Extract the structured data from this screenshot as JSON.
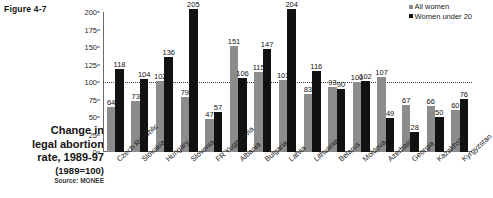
{
  "figure": {
    "label": "Figure 4-7",
    "caption_line1": "Change in",
    "caption_line2": "legal abortion",
    "caption_line3": "rate, 1989-97",
    "caption_sub": "(1989=100)",
    "caption_source": "Source: MONEE"
  },
  "legend": {
    "items": [
      {
        "label": "All women",
        "color": "#8c8c8c"
      },
      {
        "label": "Women under 20",
        "color": "#111111"
      }
    ]
  },
  "chart_data": {
    "type": "bar",
    "title": "Change in legal abortion rate, 1989-97",
    "subtitle": "(1989=100)",
    "xlabel": "",
    "ylabel": "",
    "ylim": [
      0,
      200
    ],
    "yticks": [
      0,
      25,
      50,
      75,
      100,
      125,
      150,
      175,
      200
    ],
    "grid": false,
    "reference_line": 100,
    "legend_position": "top-right",
    "categories": [
      "Czech Republic",
      "Slovakia",
      "Hungary",
      "Slovenia",
      "FR Yugoslavia",
      "Albania",
      "Bulgaria",
      "Latvia",
      "Lithuania",
      "Belarus",
      "Moldova",
      "Azerbaijan",
      "Georgia",
      "Kazakhstan",
      "Kyrgyzstan"
    ],
    "series": [
      {
        "name": "All women",
        "color": "#8c8c8c",
        "values": [
          64,
          73,
          102,
          79,
          47,
          151,
          115,
          103,
          83,
          93,
          100,
          107,
          67,
          66,
          60
        ]
      },
      {
        "name": "Women under 20",
        "color": "#111111",
        "values": [
          118,
          104,
          136,
          205,
          57,
          106,
          147,
          204,
          116,
          90,
          102,
          49,
          28,
          50,
          76
        ]
      }
    ]
  }
}
